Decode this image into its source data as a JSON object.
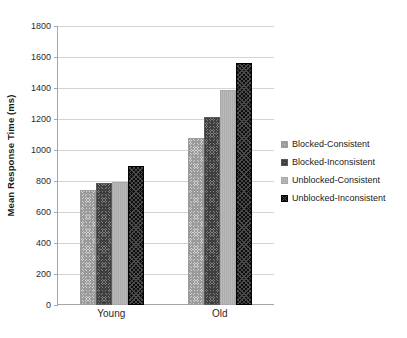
{
  "chart_data": {
    "type": "bar",
    "title": "",
    "xlabel": "",
    "ylabel": "Mean Response Time (ms)",
    "ylim": [
      0,
      1800
    ],
    "ytick_step": 200,
    "yticks": [
      1800,
      1600,
      1400,
      1200,
      1000,
      800,
      600,
      400,
      200,
      0
    ],
    "grid": true,
    "legend_position": "right",
    "categories": [
      "Young",
      "Old"
    ],
    "series": [
      {
        "name": "Blocked-Consistent",
        "values": [
          740,
          1075
        ],
        "swatch": "light-checkered",
        "color": "#d2d2d2"
      },
      {
        "name": "Blocked-Inconsistent",
        "values": [
          790,
          1215
        ],
        "swatch": "dark-checkered",
        "color": "#7e7e7e"
      },
      {
        "name": "Unblocked-Consistent",
        "values": [
          795,
          1390
        ],
        "swatch": "solid-gray",
        "color": "#b4b4b4"
      },
      {
        "name": "Unblocked-Inconsistent",
        "values": [
          900,
          1560
        ],
        "swatch": "black-dotted",
        "color": "#0d0d0d"
      }
    ]
  },
  "axes": {
    "y_title": "Mean Response Time (ms)"
  },
  "legend": {
    "items": [
      {
        "label": "Blocked-Consistent"
      },
      {
        "label": "Blocked-Inconsistent"
      },
      {
        "label": "Unblocked-Consistent"
      },
      {
        "label": "Unblocked-Inconsistent"
      }
    ]
  }
}
